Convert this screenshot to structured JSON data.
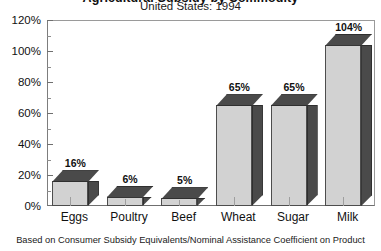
{
  "chart_data": {
    "type": "bar",
    "title": "Agricultural Subsidy by Commodity",
    "subtitle": "United States: 1994",
    "categories": [
      "Eggs",
      "Poultry",
      "Beef",
      "Wheat",
      "Sugar",
      "Milk"
    ],
    "values": [
      16,
      6,
      5,
      65,
      65,
      104
    ],
    "value_labels": [
      "16%",
      "6%",
      "5%",
      "65%",
      "65%",
      "104%"
    ],
    "xlabel": "",
    "ylabel": "",
    "ylim": [
      0,
      120
    ],
    "ytick_labels": [
      "0%",
      "20%",
      "40%",
      "60%",
      "80%",
      "100%",
      "120%"
    ],
    "ytick_values": [
      0,
      20,
      40,
      60,
      80,
      100,
      120
    ],
    "yminor_values": [
      10,
      30,
      50,
      70,
      90,
      110
    ],
    "grid": false,
    "legend": "none",
    "footnote": "Based on Consumer Subsidy Equivalents/Nominal Assistance Coefficient on Product",
    "bar_front_color": "#d2d2d2",
    "bar_shade_color": "#4a4a4a",
    "axis_color": "#6f6f6f",
    "background_color": "#ffffff"
  }
}
